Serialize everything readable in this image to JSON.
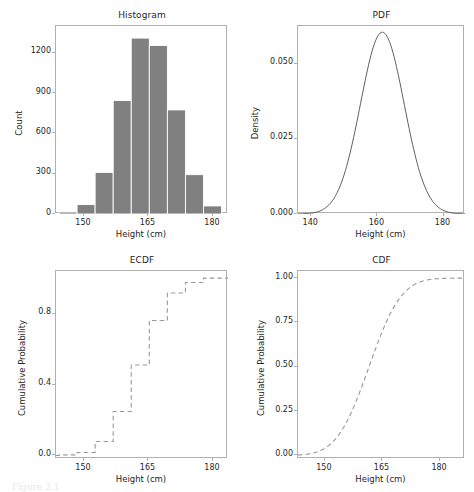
{
  "figure": {
    "width": 474,
    "height": 490,
    "background": "#ffffff",
    "caption": "Figure 2.1",
    "bar_color": "#808080",
    "line_color": "#4d4d4d",
    "axis_color": "#b0b0b0",
    "text_color": "#262626"
  },
  "chart_data": [
    {
      "type": "bar",
      "panel": "top-left",
      "title": "Histogram",
      "xlabel": "Height (cm)",
      "ylabel": "Count",
      "xlim": [
        143.5,
        183.5
      ],
      "ylim": [
        0,
        1400
      ],
      "xticks": [
        150,
        165,
        180
      ],
      "yticks": [
        0,
        300,
        600,
        900,
        1200
      ],
      "grid": false,
      "bin_edges": [
        144.2,
        148.4,
        152.6,
        156.8,
        161.0,
        165.2,
        169.4,
        173.6,
        177.8,
        182.0
      ],
      "categories": [
        "144.2-148.4",
        "148.4-152.6",
        "152.6-156.8",
        "156.8-161.0",
        "161.0-165.2",
        "165.2-169.4",
        "169.4-173.6",
        "173.6-177.8",
        "177.8-182.0"
      ],
      "values": [
        15,
        70,
        310,
        845,
        1310,
        1255,
        775,
        293,
        60
      ],
      "bar_color": "#808080",
      "bar_edge_color": "#ffffff"
    },
    {
      "type": "line",
      "panel": "top-right",
      "title": "PDF",
      "xlabel": "Height (cm)",
      "ylabel": "Density",
      "xlim": [
        136.0,
        186.5
      ],
      "ylim": [
        0.0,
        0.0625
      ],
      "xticks": [
        140,
        160,
        180
      ],
      "yticks": [
        0.0,
        0.025,
        0.05
      ],
      "ytick_labels": [
        "0.000",
        "0.025",
        "0.050"
      ],
      "grid": false,
      "distribution": "normal",
      "mean": 161.5,
      "std": 6.6,
      "peak_density": 0.0581,
      "line_color": "#4d4d4d",
      "line_style": "solid",
      "x": [
        136,
        138,
        140,
        142,
        144,
        146,
        148,
        150,
        152,
        154,
        156,
        158,
        160,
        162,
        164,
        166,
        168,
        170,
        172,
        174,
        176,
        178,
        180,
        182,
        184,
        186
      ],
      "y": [
        0.0002,
        0.0004,
        0.001,
        0.0021,
        0.0042,
        0.0077,
        0.013,
        0.0204,
        0.0296,
        0.0396,
        0.049,
        0.0559,
        0.059,
        0.0576,
        0.0521,
        0.0435,
        0.0335,
        0.0238,
        0.0156,
        0.0095,
        0.0053,
        0.0028,
        0.0013,
        0.0006,
        0.0002,
        0.0001
      ]
    },
    {
      "type": "line",
      "panel": "bottom-left",
      "title": "ECDF",
      "xlabel": "Height (cm)",
      "ylabel": "Cumulative Probability",
      "xlim": [
        143.5,
        183.5
      ],
      "ylim": [
        -0.02,
        1.04
      ],
      "xticks": [
        150,
        165,
        180
      ],
      "yticks": [
        0.0,
        0.4,
        0.8
      ],
      "ytick_labels": [
        "0.0",
        "0.4",
        "0.8"
      ],
      "grid": false,
      "line_color": "#999999",
      "line_style": "dashed",
      "step_x": [
        144.2,
        148.4,
        152.6,
        156.8,
        161.0,
        165.2,
        169.4,
        173.6,
        177.8,
        182.0
      ],
      "step_y": [
        0.0,
        0.003,
        0.017,
        0.079,
        0.248,
        0.51,
        0.761,
        0.916,
        0.975,
        1.0
      ]
    },
    {
      "type": "line",
      "panel": "bottom-right",
      "title": "CDF",
      "xlabel": "Height (cm)",
      "ylabel": "Cumulative Probability",
      "xlim": [
        143.0,
        186.5
      ],
      "ylim": [
        -0.02,
        1.04
      ],
      "xticks": [
        150,
        165,
        180
      ],
      "yticks": [
        0.0,
        0.25,
        0.5,
        0.75,
        1.0
      ],
      "ytick_labels": [
        "0.00",
        "0.25",
        "0.50",
        "0.75",
        "1.00"
      ],
      "grid": false,
      "distribution": "normal",
      "mean": 161.5,
      "std": 6.6,
      "line_color": "#999999",
      "line_style": "dashed",
      "x": [
        143,
        145,
        147,
        149,
        151,
        153,
        155,
        157,
        159,
        161,
        163,
        165,
        167,
        169,
        171,
        173,
        175,
        177,
        179,
        181,
        183,
        185,
        186.5
      ],
      "y": [
        0.0034,
        0.0077,
        0.0164,
        0.0322,
        0.0588,
        0.0996,
        0.1567,
        0.23,
        0.3168,
        0.412,
        0.509,
        0.6013,
        0.6837,
        0.7531,
        0.809,
        0.8523,
        0.8848,
        0.9086,
        0.9257,
        0.9378,
        0.9463,
        0.9521,
        0.9552
      ]
    }
  ]
}
